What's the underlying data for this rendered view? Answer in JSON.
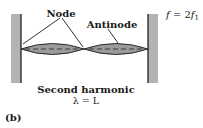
{
  "figure": {
    "labels": {
      "node": "Node",
      "antinode": "Antinode",
      "title": "Second harmonic",
      "wavelength": "λ = L",
      "panel": "(b)"
    },
    "frequency": {
      "f": "f",
      "eq": " = 2",
      "f2": "f",
      "sub": "1"
    },
    "colors": {
      "wall": "#b3b3b3",
      "wall_edge": "#111111",
      "loop_fill": "#9a9a9a",
      "string": "#1a1a1a",
      "dash": "#3a3a3a",
      "text": "#1a1a1a"
    }
  }
}
